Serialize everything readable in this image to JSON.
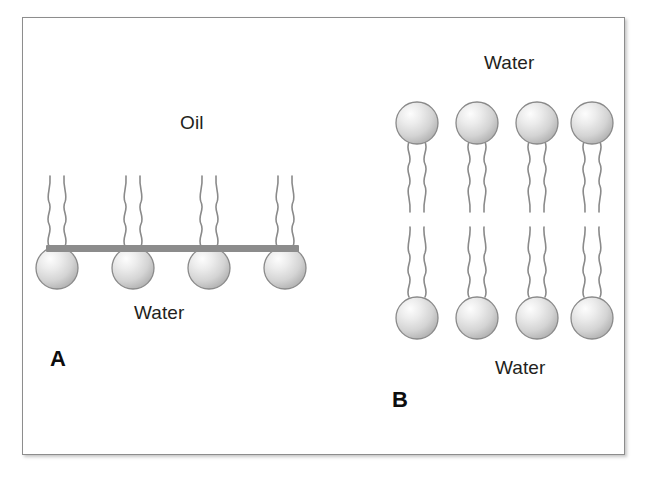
{
  "figure": {
    "type": "scientific-diagram",
    "background_color": "#ffffff",
    "frame_color": "#8d8d8d"
  },
  "colors": {
    "head_light": "#f2f2f2",
    "head_mid": "#d6d6d6",
    "head_edge": "#a9a9a9",
    "head_stroke": "#8a8a8a",
    "tail_stroke": "#8a8a8a",
    "interface_bar": "#8c8c8c",
    "text": "#231f20"
  },
  "panel_a": {
    "letter": "A",
    "arrangement": "monolayer at oil-water interface",
    "top_label": "Oil",
    "bottom_label": "Water",
    "lipid_count": 4,
    "head_position": "below interface, in water",
    "tail_direction": "up, into oil",
    "lipid_x": [
      57,
      133,
      209,
      285
    ],
    "interface": {
      "x": 46,
      "y": 245,
      "width": 253,
      "height": 7
    },
    "head_cy": 268,
    "head_r": 21,
    "tails_top_y": 172,
    "oil_label_pos": {
      "x": 180,
      "y": 123
    },
    "water_label_pos": {
      "x": 134,
      "y": 313
    },
    "letter_pos": {
      "x": 50,
      "y": 348
    }
  },
  "panel_b": {
    "letter": "B",
    "arrangement": "bilayer between two water compartments",
    "top_label": "Water",
    "bottom_label": "Water",
    "lipid_count_per_leaflet": 4,
    "total_lipid_count": 8,
    "upper_leaflet": {
      "head_direction": "up, into water",
      "tail_direction": "down, into bilayer core",
      "head_cy": 123,
      "tails_bottom_y": 215
    },
    "lower_leaflet": {
      "head_direction": "down, into water",
      "tail_direction": "up, into bilayer core",
      "head_cy": 318,
      "tails_top_y": 226
    },
    "lipid_x": [
      417,
      477,
      537,
      592
    ],
    "head_r": 21,
    "top_label_pos": {
      "x": 484,
      "y": 53
    },
    "bottom_label_pos": {
      "x": 495,
      "y": 368
    },
    "letter_pos": {
      "x": 392,
      "y": 389
    }
  }
}
